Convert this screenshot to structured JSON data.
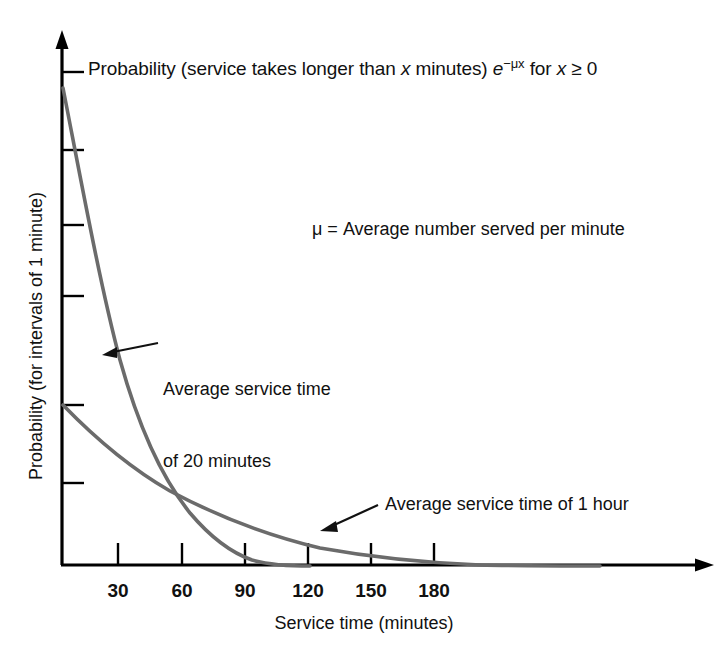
{
  "figure": {
    "title_text": "Probability (service takes longer than x minutes) e",
    "title_exponent": "−μx",
    "title_tail": " for x ≥ 0",
    "mu_note": "μ = Average number served per minute",
    "annotation_20": "Average service time\nof 20 minutes",
    "annotation_20_line1": "Average service time",
    "annotation_20_line2": "of 20 minutes",
    "annotation_60": "Average service time of 1 hour",
    "x_axis_title": "Service time (minutes)",
    "y_axis_title": "Probability (for intervals of 1 minute)",
    "curve_color": "#6b6b6b",
    "axis_color": "#000000",
    "annotation_color": "#111111",
    "background": "#ffffff"
  },
  "chart_data": {
    "type": "line",
    "xlabel": "Service time (minutes)",
    "ylabel": "Probability (for intervals of 1 minute)",
    "xlim": [
      0,
      210
    ],
    "ylim": [
      0,
      1
    ],
    "grid": false,
    "legend": "annotations",
    "xticks": [
      30,
      60,
      90,
      120,
      150,
      180
    ],
    "xtick_labels": [
      "30",
      "60",
      "90",
      "120",
      "150",
      "180"
    ],
    "yticks": [],
    "ytick_labels": [],
    "notes": [
      "μ = Average number served per minute"
    ],
    "x": [
      0,
      10,
      20,
      30,
      40,
      50,
      60,
      70,
      80,
      90,
      100,
      110,
      120,
      130,
      140,
      150,
      160,
      170,
      180,
      190,
      200,
      210
    ],
    "series": [
      {
        "name": "Average service time of 20 minutes",
        "mean_minutes": 20,
        "mu": 0.05,
        "values": [
          1.0,
          0.607,
          0.368,
          0.223,
          0.135,
          0.082,
          0.05,
          0.03,
          0.018,
          0.011,
          0.0067,
          0.0041,
          0.0025,
          0.0015,
          0.0009,
          0.00055,
          0.00034,
          0.0002,
          0.00012,
          7e-05,
          5e-05,
          3e-05
        ]
      },
      {
        "name": "Average service time of 1 hour",
        "mean_minutes": 60,
        "mu": 0.01667,
        "values": [
          0.3,
          0.254,
          0.215,
          0.182,
          0.154,
          0.131,
          0.11,
          0.093,
          0.079,
          0.067,
          0.057,
          0.048,
          0.041,
          0.035,
          0.029,
          0.025,
          0.021,
          0.018,
          0.015,
          0.013,
          0.011,
          0.009
        ]
      }
    ],
    "annotations": [
      {
        "text": "Average service time of 20 minutes",
        "points_to_series": "Average service time of 20 minutes"
      },
      {
        "text": "Average service time of 1 hour",
        "points_to_series": "Average service time of 1 hour"
      }
    ]
  },
  "xtick_labels": [
    "30",
    "60",
    "90",
    "120",
    "150",
    "180"
  ]
}
